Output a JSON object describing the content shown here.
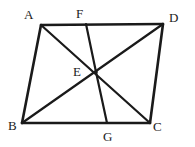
{
  "figure": {
    "background_color": "#ffffff",
    "stroke_color": "#1a1a1a",
    "label_color": "#1a1a1a",
    "perimeter_stroke_width": 2.6,
    "interior_stroke_width": 2.2,
    "points": {
      "A": {
        "label": "A",
        "x": 41,
        "y": 25,
        "label_x": 24,
        "label_y": 8
      },
      "B": {
        "label": "B",
        "x": 22,
        "y": 123,
        "label_x": 8,
        "label_y": 119
      },
      "C": {
        "label": "C",
        "x": 150,
        "y": 123,
        "label_x": 153,
        "label_y": 120
      },
      "D": {
        "label": "D",
        "x": 163,
        "y": 24,
        "label_x": 169,
        "label_y": 11
      },
      "E": {
        "label": "E",
        "x": 96,
        "y": 72,
        "label_x": 73,
        "label_y": 65
      },
      "F": {
        "label": "F",
        "x": 86,
        "y": 24,
        "label_x": 76,
        "label_y": 7
      },
      "G": {
        "label": "G",
        "x": 107,
        "y": 123,
        "label_x": 103,
        "label_y": 130
      }
    },
    "segments": [
      {
        "name": "side-AD",
        "from": "A",
        "to": "D",
        "kind": "perimeter"
      },
      {
        "name": "side-AB",
        "from": "A",
        "to": "B",
        "kind": "perimeter"
      },
      {
        "name": "side-BC",
        "from": "B",
        "to": "C",
        "kind": "perimeter"
      },
      {
        "name": "side-DC",
        "from": "D",
        "to": "C",
        "kind": "perimeter"
      },
      {
        "name": "diagonal-AC",
        "from": "A",
        "to": "C",
        "kind": "interior"
      },
      {
        "name": "diagonal-BD",
        "from": "B",
        "to": "D",
        "kind": "interior"
      },
      {
        "name": "cevian-FE",
        "from": "F",
        "to": "E",
        "kind": "interior"
      },
      {
        "name": "cevian-EG",
        "from": "E",
        "to": "G",
        "kind": "interior"
      }
    ]
  }
}
